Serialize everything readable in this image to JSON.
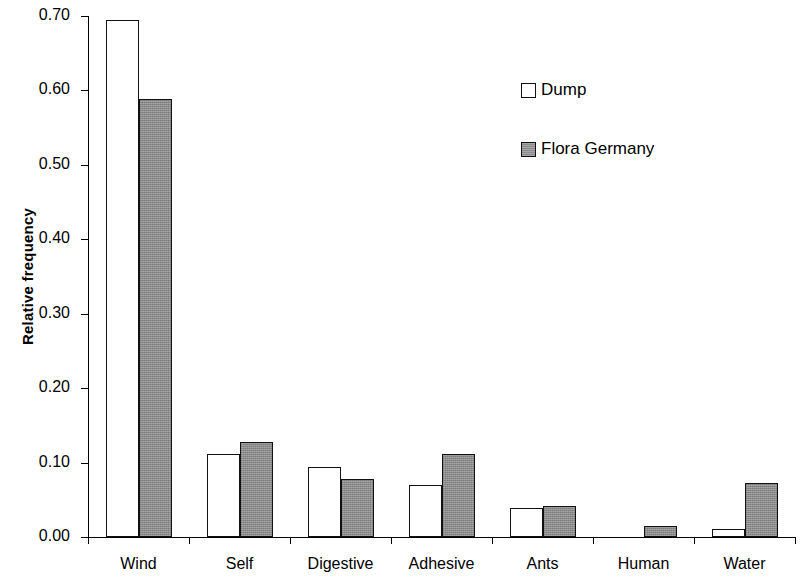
{
  "chart_data": {
    "type": "bar",
    "title": "",
    "xlabel": "",
    "ylabel": "Relative frequency",
    "ylim": [
      0.0,
      0.7
    ],
    "yticks": [
      "0.00",
      "0.10",
      "0.20",
      "0.30",
      "0.40",
      "0.50",
      "0.60",
      "0.70"
    ],
    "ytick_values": [
      0.0,
      0.1,
      0.2,
      0.3,
      0.4,
      0.5,
      0.6,
      0.7
    ],
    "grid": false,
    "legend_position": "upper-right",
    "categories": [
      "Wind",
      "Self",
      "Digestive",
      "Adhesive",
      "Ants",
      "Human",
      "Water"
    ],
    "series": [
      {
        "name": "Dump",
        "color": "#ffffff",
        "values": [
          0.695,
          0.112,
          0.094,
          0.07,
          0.039,
          0.0,
          0.011
        ]
      },
      {
        "name": "Flora Germany",
        "color": "#8c8c8c",
        "values": [
          0.589,
          0.128,
          0.078,
          0.111,
          0.042,
          0.015,
          0.073
        ]
      }
    ]
  },
  "legend": {
    "items": [
      {
        "label": "Dump",
        "swatch": "hollow-square-icon"
      },
      {
        "label": "Flora Germany",
        "swatch": "filled-square-icon"
      }
    ]
  }
}
